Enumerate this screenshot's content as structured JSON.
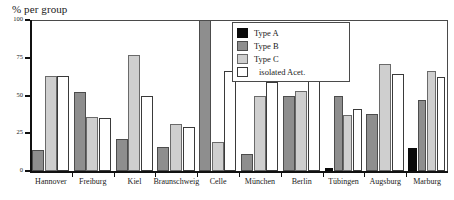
{
  "chart_data": {
    "type": "bar",
    "title": "% per group",
    "xlabel": "",
    "ylabel": "% per group",
    "ylim": [
      0,
      100
    ],
    "yticks": [
      0,
      25,
      50,
      75,
      100
    ],
    "ytick_labels": [
      "0",
      "25",
      "50",
      "75",
      "100"
    ],
    "grid": false,
    "legend_position": "top-center",
    "categories": [
      "Hannover",
      "Freiburg",
      "Kiel",
      "Braunschweig",
      "Celle",
      "München",
      "Berlin",
      "Tübingen",
      "Augsburg",
      "Marburg"
    ],
    "series": [
      {
        "name": "Type A",
        "color": "#0a0a0a",
        "values": [
          0,
          0,
          0,
          0,
          0,
          0,
          0,
          2,
          0,
          15
        ]
      },
      {
        "name": "Type B",
        "color": "#8e8e8e",
        "values": [
          14,
          52,
          21,
          16,
          100,
          11,
          50,
          50,
          38,
          47
        ]
      },
      {
        "name": "Type C",
        "color": "#cfcfcf",
        "values": [
          63,
          36,
          77,
          31,
          19,
          50,
          53,
          37,
          71,
          66
        ]
      },
      {
        "name": "isolated Acet.",
        "color": "#ffffff",
        "values": [
          63,
          35,
          50,
          29,
          66,
          59,
          66,
          41,
          64,
          62
        ]
      }
    ]
  },
  "legend": {
    "entries": [
      {
        "label": "Type A",
        "swatch": "t-a"
      },
      {
        "label": "Type B",
        "swatch": "t-b"
      },
      {
        "label": "Type C",
        "swatch": "t-c"
      },
      {
        "label": "isolated Acet.",
        "swatch": "t-d"
      }
    ]
  }
}
